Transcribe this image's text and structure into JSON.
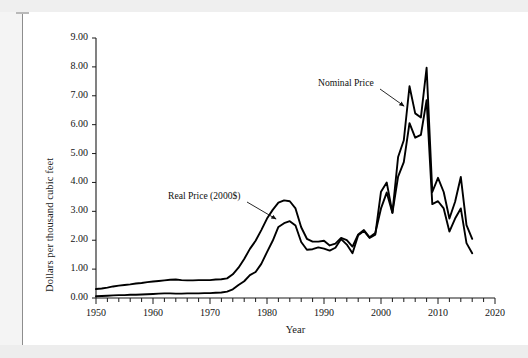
{
  "page": {
    "background_color": "#f4f4f4",
    "paper_color": "#ffffff"
  },
  "chart_data": {
    "type": "line",
    "title": "",
    "xlabel": "Year",
    "ylabel": "Dollars per thousand cubic feet",
    "xlim": [
      1950,
      2020
    ],
    "ylim": [
      0.0,
      9.0
    ],
    "x_major_ticks": [
      1950,
      1960,
      1970,
      1980,
      1990,
      2000,
      2010,
      2020
    ],
    "x_major_tick_labels": [
      "1950",
      "1960",
      "1970",
      "1980",
      "1990",
      "2000",
      "2010",
      "2020"
    ],
    "x_minor_tick_step": 2,
    "y_ticks": [
      0.0,
      1.0,
      2.0,
      3.0,
      4.0,
      5.0,
      6.0,
      7.0,
      8.0,
      9.0
    ],
    "y_tick_labels": [
      "0.00",
      "1.00",
      "2.00",
      "3.00",
      "4.00",
      "5.00",
      "6.00",
      "7.00",
      "8.00",
      "9.00"
    ],
    "grid": false,
    "legend_position": "annotations",
    "line_color": "#000000",
    "annotations": [
      {
        "text": "Real Price (2000$)",
        "label_x_px": 168,
        "label_y_px": 190,
        "arrow_from_px": [
          247,
          202
        ],
        "arrow_to_px": [
          276,
          219
        ]
      },
      {
        "text": "Nominal Price",
        "label_x_px": 318,
        "label_y_px": 77,
        "arrow_from_px": [
          380,
          89
        ],
        "arrow_to_px": [
          404,
          106
        ]
      }
    ],
    "x": [
      1950,
      1951,
      1952,
      1953,
      1954,
      1955,
      1956,
      1957,
      1958,
      1959,
      1960,
      1961,
      1962,
      1963,
      1964,
      1965,
      1966,
      1967,
      1968,
      1969,
      1970,
      1971,
      1972,
      1973,
      1974,
      1975,
      1976,
      1977,
      1978,
      1979,
      1980,
      1981,
      1982,
      1983,
      1984,
      1985,
      1986,
      1987,
      1988,
      1989,
      1990,
      1991,
      1992,
      1993,
      1994,
      1995,
      1996,
      1997,
      1998,
      1999,
      2000,
      2001,
      2002,
      2003,
      2004,
      2005,
      2006,
      2007,
      2008,
      2009,
      2010,
      2011,
      2012,
      2013,
      2014,
      2015,
      2016
    ],
    "series": [
      {
        "name": "Real Price (2000$)",
        "values": [
          0.31,
          0.33,
          0.36,
          0.4,
          0.43,
          0.45,
          0.47,
          0.5,
          0.52,
          0.55,
          0.57,
          0.59,
          0.61,
          0.63,
          0.64,
          0.62,
          0.61,
          0.61,
          0.62,
          0.62,
          0.62,
          0.64,
          0.65,
          0.68,
          0.82,
          1.05,
          1.35,
          1.7,
          1.98,
          2.35,
          2.75,
          3.05,
          3.3,
          3.38,
          3.35,
          3.1,
          2.45,
          2.05,
          1.95,
          1.95,
          1.98,
          1.82,
          1.88,
          2.08,
          2.0,
          1.78,
          2.2,
          2.35,
          2.1,
          2.25,
          3.1,
          3.65,
          2.95,
          4.2,
          4.7,
          6.05,
          5.55,
          5.65,
          6.85,
          3.25,
          3.35,
          3.1,
          2.3,
          2.75,
          3.1,
          1.9,
          1.55
        ]
      },
      {
        "name": "Nominal Price",
        "values": [
          0.06,
          0.07,
          0.08,
          0.09,
          0.1,
          0.1,
          0.11,
          0.11,
          0.12,
          0.13,
          0.14,
          0.15,
          0.16,
          0.16,
          0.15,
          0.15,
          0.16,
          0.16,
          0.16,
          0.17,
          0.17,
          0.18,
          0.19,
          0.22,
          0.3,
          0.45,
          0.58,
          0.79,
          0.9,
          1.18,
          1.59,
          1.98,
          2.46,
          2.59,
          2.66,
          2.51,
          1.94,
          1.67,
          1.69,
          1.75,
          1.71,
          1.64,
          1.74,
          2.04,
          1.85,
          1.55,
          2.17,
          2.32,
          2.08,
          2.19,
          3.68,
          4.0,
          2.95,
          4.88,
          5.46,
          7.33,
          6.39,
          6.25,
          7.97,
          3.67,
          4.16,
          3.67,
          2.75,
          3.33,
          4.19,
          2.52,
          2.05
        ]
      }
    ]
  },
  "axis_titles": {
    "y": "Dollars per thousand cubic feet",
    "x": "Year"
  }
}
